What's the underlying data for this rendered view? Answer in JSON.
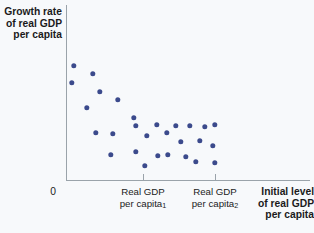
{
  "figure": {
    "name": "convergence-scatter-plot"
  },
  "axes": {
    "y_title": "Growth rate\nof real GDP\nper capita",
    "x_title": "Initial level\nof real GDP\nper capita",
    "origin_label": "0",
    "tick_label_1_line1": "Real GDP",
    "tick_label_1_line2": "per capita",
    "tick_label_1_sub": "1",
    "tick_label_2_line1": "Real GDP",
    "tick_label_2_line2": "per capita",
    "tick_label_2_sub": "2"
  },
  "colors": {
    "dot": "#3b4a8c",
    "axis": "#9aa3aa",
    "background": "#f7f9fb",
    "text": "#1b1b1b"
  },
  "chart_data": {
    "type": "scatter",
    "title": "",
    "xlabel": "Initial level of real GDP per capita",
    "ylabel": "Growth rate of real GDP per capita",
    "grid": false,
    "legend": null,
    "xlim": [
      0,
      1
    ],
    "ylim": [
      0,
      1
    ],
    "xticks": [
      0.315,
      0.61
    ],
    "xtick_labels": [
      "Real GDP per capita₁",
      "Real GDP per capita₂"
    ],
    "yticks": [],
    "ytick_labels": [],
    "annotations": [
      "0"
    ],
    "note": "Downward-sloping scatter: countries with low initial real GDP per capita show high growth rates (convergence). Point coordinates given in pixel space of the 314x233 figure.",
    "points_px": [
      [
        74,
        66
      ],
      [
        93,
        74
      ],
      [
        72,
        83
      ],
      [
        100,
        92
      ],
      [
        118,
        100
      ],
      [
        87,
        108
      ],
      [
        134,
        118
      ],
      [
        96,
        133
      ],
      [
        113,
        134
      ],
      [
        136,
        126
      ],
      [
        157,
        125
      ],
      [
        167,
        133
      ],
      [
        147,
        136
      ],
      [
        176,
        126
      ],
      [
        190,
        126
      ],
      [
        205,
        127
      ],
      [
        215,
        125
      ],
      [
        111,
        155
      ],
      [
        136,
        152
      ],
      [
        158,
        156
      ],
      [
        168,
        155
      ],
      [
        145,
        166
      ],
      [
        181,
        142
      ],
      [
        200,
        141
      ],
      [
        213,
        146
      ],
      [
        196,
        162
      ],
      [
        215,
        163
      ],
      [
        186,
        157
      ]
    ]
  }
}
